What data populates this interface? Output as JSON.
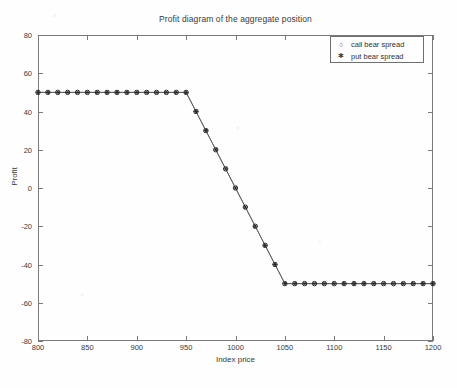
{
  "chart_data": {
    "type": "line",
    "title": "Profit diagram of the aggregate position",
    "xlabel": "Index price",
    "ylabel": "Profit",
    "xlim": [
      800,
      1200
    ],
    "ylim": [
      -80,
      80
    ],
    "xticks": [
      800,
      850,
      900,
      950,
      1000,
      1050,
      1100,
      1150,
      1200
    ],
    "yticks": [
      80,
      60,
      40,
      20,
      0,
      -20,
      -40,
      -60,
      -80
    ],
    "grid": false,
    "legend_position": "upper right",
    "x": [
      800,
      810,
      820,
      830,
      840,
      850,
      860,
      870,
      880,
      890,
      900,
      910,
      920,
      930,
      940,
      950,
      960,
      970,
      980,
      990,
      1000,
      1010,
      1020,
      1030,
      1040,
      1050,
      1060,
      1070,
      1080,
      1090,
      1100,
      1110,
      1120,
      1130,
      1140,
      1150,
      1160,
      1170,
      1180,
      1190,
      1200
    ],
    "series": [
      {
        "name": "call bear spread",
        "marker": "circle",
        "values": [
          50,
          50,
          50,
          50,
          50,
          50,
          50,
          50,
          50,
          50,
          50,
          50,
          50,
          50,
          50,
          50,
          40,
          30,
          20,
          10,
          0,
          -10,
          -20,
          -30,
          -40,
          -50,
          -50,
          -50,
          -50,
          -50,
          -50,
          -50,
          -50,
          -50,
          -50,
          -50,
          -50,
          -50,
          -50,
          -50,
          -50
        ]
      },
      {
        "name": "put bear spread",
        "marker": "asterisk",
        "values": [
          50,
          50,
          50,
          50,
          50,
          50,
          50,
          50,
          50,
          50,
          50,
          50,
          50,
          50,
          50,
          50,
          40,
          30,
          20,
          10,
          0,
          -10,
          -20,
          -30,
          -40,
          -50,
          -50,
          -50,
          -50,
          -50,
          -50,
          -50,
          -50,
          -50,
          -50,
          -50,
          -50,
          -50,
          -50,
          -50,
          -50
        ]
      }
    ],
    "annotations": {
      "upper_plateau_value": 50,
      "lower_plateau_value": -50,
      "breakpoint_low": 950,
      "breakpoint_high": 1050
    }
  },
  "legend": {
    "entries": [
      {
        "label": "call bear spread",
        "marker_glyph": "○"
      },
      {
        "label": "put bear spread",
        "marker_glyph": "✱"
      }
    ]
  },
  "colors": {
    "line": "#555555",
    "marker": "#222222",
    "axis": "#7a7a7a",
    "text": "#333333",
    "background": "#fefefe"
  }
}
